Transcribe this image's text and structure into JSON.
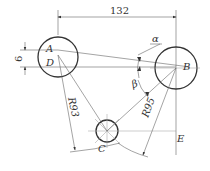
{
  "diagram": {
    "type": "engineering-geometry-drawing",
    "points": [
      {
        "id": "A",
        "label": "A"
      },
      {
        "id": "B",
        "label": "B"
      },
      {
        "id": "C",
        "label": "C"
      },
      {
        "id": "D",
        "label": "D"
      },
      {
        "id": "E",
        "label": "E"
      }
    ],
    "dimensions": {
      "horizontal": "132",
      "vertical": "6",
      "radius_ac": "R93",
      "radius_bc": "R95"
    },
    "angles": {
      "alpha": "α",
      "beta": "β"
    },
    "colors": {
      "line": "#333333",
      "thin": "#666666",
      "background": "#ffffff"
    }
  }
}
